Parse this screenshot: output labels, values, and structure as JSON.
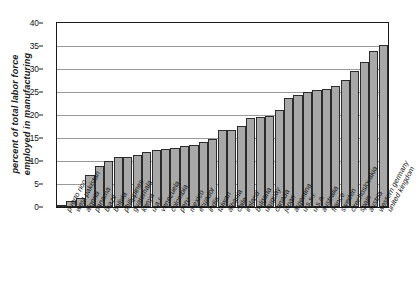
{
  "chart_data": {
    "type": "bar",
    "title": "",
    "subtitle": "",
    "xlabel": "",
    "ylabel": "percent of total labor force employed in manufacturing",
    "ylabel_lines": [
      "percent of total labor force",
      "employed in manufacturing"
    ],
    "ylim": [
      0,
      40
    ],
    "yticks": [
      0,
      5,
      10,
      15,
      20,
      25,
      30,
      35,
      40
    ],
    "grid": "horizontal",
    "legend": "none",
    "bar_fill_color": "#a8a8a8",
    "bar_edge_color": "#2b2b2b",
    "axis_color": "#1a1a1a",
    "gridline_color": "#9a9a9a",
    "categories": [
      "puerto rico",
      "west pakistan",
      "algeria",
      "panama",
      "brazil",
      "bolivia",
      "philippines",
      "guatemala",
      "kenya",
      "u.a.r.",
      "venezuela",
      "colombia",
      "peru",
      "mexico",
      "ecuador",
      "india",
      "taiwan",
      "albania",
      "chile",
      "ireland",
      "bulgaria",
      "uruguay",
      "canada",
      "japan",
      "argentina",
      "u.s.s.r.",
      "u.s.a.",
      "australia",
      "france",
      "sweden",
      "czechoslovakia",
      "spain",
      "austria",
      "western germany",
      "united kingdom"
    ],
    "values": [
      0.5,
      1.2,
      2.0,
      7.0,
      9.0,
      10.1,
      10.9,
      10.9,
      11.4,
      11.9,
      12.3,
      12.6,
      12.9,
      13.2,
      13.5,
      14.2,
      14.8,
      16.8,
      16.8,
      17.6,
      19.3,
      19.5,
      19.8,
      21.0,
      23.6,
      24.3,
      25.0,
      25.4,
      25.6,
      26.3,
      27.7,
      29.6,
      31.6,
      34.0,
      35.3
    ]
  }
}
